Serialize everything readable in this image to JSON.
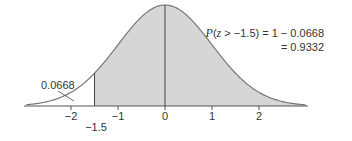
{
  "chart_data": {
    "type": "area",
    "title": "",
    "xlabel": "",
    "ylabel": "",
    "xlim": [
      -2.95,
      3.0
    ],
    "x_ticks": [
      -2,
      -1,
      0,
      1,
      2
    ],
    "x_tick_labels": [
      "−2",
      "−1",
      "0",
      "1",
      "2"
    ],
    "extra_tick_label": "−1.5",
    "shaded_region": {
      "from": -1.5,
      "to": 3.0,
      "color": "#d6d6d6"
    },
    "vertical_lines": [
      -1.5,
      0
    ],
    "curve_color": "#777777",
    "left_tail_area": "0.0668",
    "annotation_line1_prefix": "P(",
    "annotation_line1_var": "z",
    "annotation_line1_rest": " > −1.5) = 1 − 0.0668",
    "annotation_line2": "= 0.9332",
    "grid": false
  }
}
